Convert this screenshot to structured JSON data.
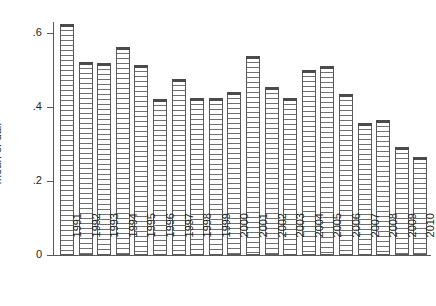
{
  "chart_data": {
    "type": "bar",
    "title": "",
    "xlabel": "",
    "ylabel": "mean of dair",
    "categories": [
      "1991",
      "1992",
      "1993",
      "1994",
      "1995",
      "1996",
      "1997",
      "1998",
      "1999",
      "2000",
      "2001",
      "2002",
      "2003",
      "2004",
      "2005",
      "2006",
      "2007",
      "2008",
      "2009",
      "2010"
    ],
    "values": [
      0.624,
      0.522,
      0.52,
      0.562,
      0.514,
      0.422,
      0.476,
      0.424,
      0.424,
      0.44,
      0.538,
      0.454,
      0.424,
      0.5,
      0.511,
      0.435,
      0.357,
      0.365,
      0.292,
      0.265
    ],
    "ylim": [
      0,
      0.65
    ],
    "yticks": [
      0,
      0.2,
      0.4,
      0.6
    ],
    "ytick_labels": [
      "0",
      ".2",
      ".4",
      ".6"
    ],
    "grid": false,
    "legend": null,
    "bar_fill": "horizontal-hatch",
    "bar_edge_color": "#58595b",
    "background_color": "#ffffff",
    "axis_color": "#58595b"
  }
}
